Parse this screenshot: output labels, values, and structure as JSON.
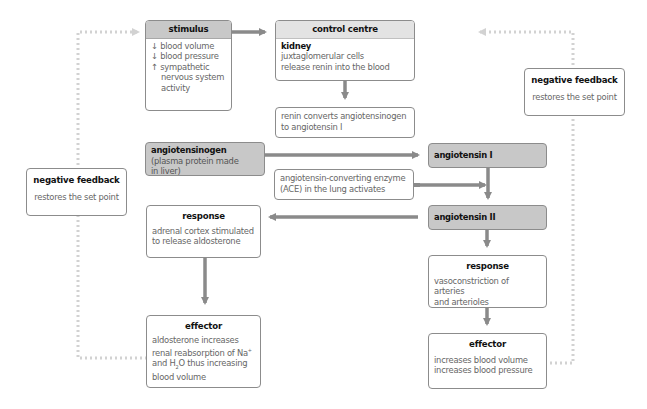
{
  "stimulus": {
    "title": "stimulus",
    "items": [
      {
        "icon": "↓",
        "text": "blood volume"
      },
      {
        "icon": "↓",
        "text": "blood pressure"
      },
      {
        "icon": "↑",
        "text": "sympathetic"
      }
    ],
    "cont1": "nervous system",
    "cont2": "activity"
  },
  "control_centre": {
    "title": "control centre",
    "organ": "kidney",
    "line1": "juxtaglomerular cells",
    "line2": "release renin into the blood"
  },
  "renin_step": {
    "line1": "renin converts angiotensinogen",
    "line2": "to angiotensin I"
  },
  "angiotensinogen": {
    "title": "angiotensinogen",
    "line1": "(plasma protein made",
    "line2": "in liver)"
  },
  "angiotensin1": {
    "title": "angiotensin I"
  },
  "ace_step": {
    "line1": "angiotensin-converting enzyme",
    "line2": "(ACE) in the lung activates"
  },
  "angiotensin2": {
    "title": "angiotensin II"
  },
  "response_left": {
    "title": "response",
    "line1": "adrenal cortex stimulated",
    "line2": "to release aldosterone"
  },
  "effector_left": {
    "title": "effector",
    "line1": "aldosterone increases",
    "line2a": "renal reabsorption of Na",
    "line2sup": "+",
    "line3a": "and H",
    "line3sub": "2",
    "line3b": "O thus increasing",
    "line4": "blood volume"
  },
  "response_right": {
    "title": "response",
    "line1": "vasoconstriction of arteries",
    "line2": "and arterioles"
  },
  "effector_right": {
    "title": "effector",
    "line1": "increases blood volume",
    "line2": "increases blood pressure"
  },
  "feedback_left": {
    "title": "negative feedback",
    "text": "restores the set point"
  },
  "feedback_right": {
    "title": "negative feedback",
    "text": "restores the set point"
  },
  "colors": {
    "arrow": "#8a8a8a",
    "dotted": "#d2d2d2",
    "header_dark": "#c8c8c8",
    "header_light": "#e3e3e3"
  }
}
